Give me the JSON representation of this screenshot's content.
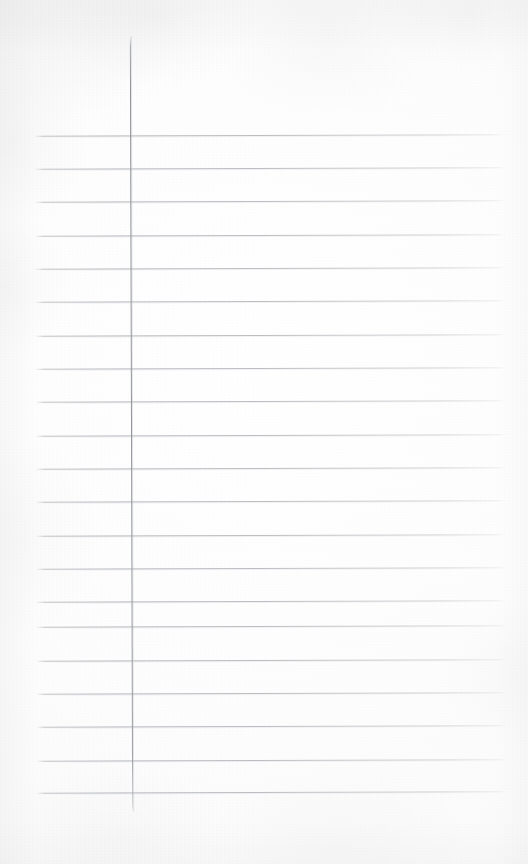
{
  "document": {
    "kind": "scanned-paper",
    "title": "Ruled notebook paper",
    "description": "Blank single sheet of lined writing paper with a vertical left margin rule",
    "content_text": "",
    "is_blank": true
  },
  "sheet": {
    "width": 528,
    "height": 864,
    "paper_color": "#fdfdfd",
    "edge_tint_color": "#8c8e92"
  },
  "ruling": {
    "line_color": "#babcc0",
    "ghost_color": "#d6d8dc",
    "line_thickness": 1,
    "line_spacing": 33.5,
    "line_start_x": 35,
    "line_end_x": 506,
    "first_line_y": 135,
    "line_count": 20,
    "rotation_deg": -0.17,
    "lines": [
      {
        "index": 1,
        "y": 135
      },
      {
        "index": 2,
        "y": 168
      },
      {
        "index": 3,
        "y": 201
      },
      {
        "index": 4,
        "y": 235
      },
      {
        "index": 5,
        "y": 268
      },
      {
        "index": 6,
        "y": 301
      },
      {
        "index": 7,
        "y": 335
      },
      {
        "index": 8,
        "y": 368
      },
      {
        "index": 9,
        "y": 401
      },
      {
        "index": 10,
        "y": 435
      },
      {
        "index": 11,
        "y": 468
      },
      {
        "index": 12,
        "y": 501
      },
      {
        "index": 13,
        "y": 535
      },
      {
        "index": 14,
        "y": 568
      },
      {
        "index": 15,
        "y": 601
      },
      {
        "index": 16,
        "y": 626
      },
      {
        "index": 17,
        "y": 660
      },
      {
        "index": 18,
        "y": 693
      },
      {
        "index": 19,
        "y": 726
      },
      {
        "index": 20,
        "y": 760
      },
      {
        "index": 21,
        "y": 792
      }
    ]
  },
  "margin_rule": {
    "color": "#92949a",
    "thickness": 1,
    "x": 131,
    "top_y": 36,
    "bottom_y": 812,
    "rotation_deg": -0.17
  },
  "regions": {
    "left_margin": {
      "x": 0,
      "y": 0,
      "width": 131,
      "height": 864
    },
    "writing_area": {
      "x": 132,
      "y": 36,
      "width": 374,
      "height": 776
    },
    "head_space": {
      "x": 0,
      "y": 0,
      "width": 528,
      "height": 135
    },
    "foot_space": {
      "x": 0,
      "y": 792,
      "width": 528,
      "height": 72
    }
  }
}
